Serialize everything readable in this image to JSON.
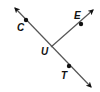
{
  "diagram": {
    "type": "geometry-lines",
    "colors": {
      "line": "#555555",
      "point": "#111111",
      "label": "#111111",
      "background": "#ffffff"
    },
    "points": [
      {
        "id": "C",
        "label": "C",
        "x": 26,
        "y": 20,
        "label_x": 17,
        "label_y": 31
      },
      {
        "id": "U",
        "label": "U",
        "x": 51,
        "y": 47,
        "label_x": 41,
        "label_y": 55
      },
      {
        "id": "E",
        "label": "E",
        "x": 81,
        "y": 24,
        "label_x": 74,
        "label_y": 19
      },
      {
        "id": "T",
        "label": "T",
        "x": 69,
        "y": 66,
        "label_x": 61,
        "label_y": 79
      }
    ],
    "line_CT": {
      "description": "line through C, U, T with arrows at both ends",
      "start": [
        13,
        6
      ],
      "end": [
        93,
        89
      ]
    },
    "ray_UE": {
      "description": "ray from U through E",
      "start": [
        51,
        47
      ],
      "end": [
        95,
        8
      ]
    }
  }
}
